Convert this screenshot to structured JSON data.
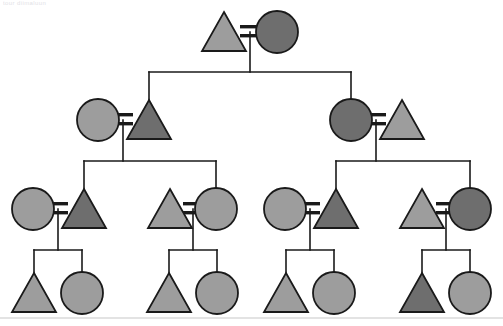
{
  "figure": {
    "title_fragment": "tour diimaluun",
    "kind": "pedigree-chart",
    "width": 503,
    "height": 326
  },
  "style": {
    "background": "#ffffff",
    "line_color": "#1a1a1a",
    "shape_stroke": "#1a1a1a",
    "fill_light": "#9d9d9d",
    "fill_dark": "#6e6e6e",
    "rule_color": "#c8c8c8",
    "line_width": 1.6,
    "shape_stroke_width": 1.8
  },
  "legend": {
    "triangle_meaning": "male",
    "circle_meaning": "female",
    "light_meaning": "unaffected",
    "dark_meaning": "affected",
    "equals_meaning": "mating"
  },
  "generations": [
    {
      "id": "I",
      "y": 32,
      "individuals": [
        {
          "id": "I-1",
          "shape": "triangle",
          "fill": "light",
          "cx": 224,
          "cy": 32
        },
        {
          "id": "I-2",
          "shape": "circle",
          "fill": "dark",
          "cx": 277,
          "cy": 32
        }
      ],
      "matings": [
        {
          "left": "I-1",
          "right": "I-2",
          "x": 250,
          "y": 32
        }
      ]
    },
    {
      "id": "II",
      "y": 120,
      "individuals": [
        {
          "id": "II-1",
          "shape": "circle",
          "fill": "light",
          "cx": 98,
          "cy": 120
        },
        {
          "id": "II-2",
          "shape": "triangle",
          "fill": "dark",
          "cx": 149,
          "cy": 120
        },
        {
          "id": "II-3",
          "shape": "circle",
          "fill": "dark",
          "cx": 351,
          "cy": 120
        },
        {
          "id": "II-4",
          "shape": "triangle",
          "fill": "light",
          "cx": 402,
          "cy": 120
        }
      ],
      "matings": [
        {
          "left": "II-1",
          "right": "II-2",
          "x": 123,
          "y": 120
        },
        {
          "left": "II-3",
          "right": "II-4",
          "x": 376,
          "y": 120
        }
      ]
    },
    {
      "id": "III",
      "y": 209,
      "individuals": [
        {
          "id": "III-1",
          "shape": "circle",
          "fill": "light",
          "cx": 33,
          "cy": 209
        },
        {
          "id": "III-2",
          "shape": "triangle",
          "fill": "dark",
          "cx": 84,
          "cy": 209
        },
        {
          "id": "III-3",
          "shape": "triangle",
          "fill": "light",
          "cx": 170,
          "cy": 209
        },
        {
          "id": "III-4",
          "shape": "circle",
          "fill": "light",
          "cx": 216,
          "cy": 209
        },
        {
          "id": "III-5",
          "shape": "circle",
          "fill": "light",
          "cx": 285,
          "cy": 209
        },
        {
          "id": "III-6",
          "shape": "triangle",
          "fill": "dark",
          "cx": 336,
          "cy": 209
        },
        {
          "id": "III-7",
          "shape": "triangle",
          "fill": "light",
          "cx": 422,
          "cy": 209
        },
        {
          "id": "III-8",
          "shape": "circle",
          "fill": "dark",
          "cx": 470,
          "cy": 209
        }
      ],
      "matings": [
        {
          "left": "III-1",
          "right": "III-2",
          "x": 58,
          "y": 209
        },
        {
          "left": "III-3",
          "right": "III-4",
          "x": 193,
          "y": 209
        },
        {
          "left": "III-5",
          "right": "III-6",
          "x": 310,
          "y": 209
        },
        {
          "left": "III-7",
          "right": "III-8",
          "x": 446,
          "y": 209
        }
      ]
    },
    {
      "id": "IV",
      "y": 293,
      "individuals": [
        {
          "id": "IV-1",
          "shape": "triangle",
          "fill": "light",
          "cx": 34,
          "cy": 293
        },
        {
          "id": "IV-2",
          "shape": "circle",
          "fill": "light",
          "cx": 82,
          "cy": 293
        },
        {
          "id": "IV-3",
          "shape": "triangle",
          "fill": "light",
          "cx": 169,
          "cy": 293
        },
        {
          "id": "IV-4",
          "shape": "circle",
          "fill": "light",
          "cx": 217,
          "cy": 293
        },
        {
          "id": "IV-5",
          "shape": "triangle",
          "fill": "light",
          "cx": 286,
          "cy": 293
        },
        {
          "id": "IV-6",
          "shape": "circle",
          "fill": "light",
          "cx": 334,
          "cy": 293
        },
        {
          "id": "IV-7",
          "shape": "triangle",
          "fill": "dark",
          "cx": 422,
          "cy": 293
        },
        {
          "id": "IV-8",
          "shape": "circle",
          "fill": "light",
          "cx": 470,
          "cy": 293
        }
      ]
    }
  ],
  "descent_lines": [
    {
      "from_mating": "I",
      "drop_from_y": 32,
      "bus_y": 72,
      "bus_x1": 149,
      "bus_x2": 351,
      "stem_x": 250,
      "children_x": [
        149,
        351
      ]
    },
    {
      "from_mating": "II-a",
      "drop_from_y": 120,
      "bus_y": 161,
      "bus_x1": 84,
      "bus_x2": 216,
      "stem_x": 123,
      "children_x": [
        84,
        216
      ]
    },
    {
      "from_mating": "II-b",
      "drop_from_y": 120,
      "bus_y": 161,
      "bus_x1": 336,
      "bus_x2": 470,
      "stem_x": 376,
      "children_x": [
        336,
        470
      ]
    },
    {
      "from_mating": "III-a",
      "drop_from_y": 209,
      "bus_y": 250,
      "bus_x1": 34,
      "bus_x2": 82,
      "stem_x": 58,
      "children_x": [
        34,
        82
      ]
    },
    {
      "from_mating": "III-b",
      "drop_from_y": 209,
      "bus_y": 250,
      "bus_x1": 169,
      "bus_x2": 217,
      "stem_x": 193,
      "children_x": [
        169,
        217
      ]
    },
    {
      "from_mating": "III-c",
      "drop_from_y": 209,
      "bus_y": 250,
      "bus_x1": 286,
      "bus_x2": 334,
      "stem_x": 310,
      "children_x": [
        286,
        334
      ]
    },
    {
      "from_mating": "III-d",
      "drop_from_y": 209,
      "bus_y": 250,
      "bus_x1": 422,
      "bus_x2": 470,
      "stem_x": 446,
      "children_x": [
        422,
        470
      ]
    }
  ],
  "bottom_rule": {
    "y": 318,
    "x1": 0,
    "x2": 503
  }
}
